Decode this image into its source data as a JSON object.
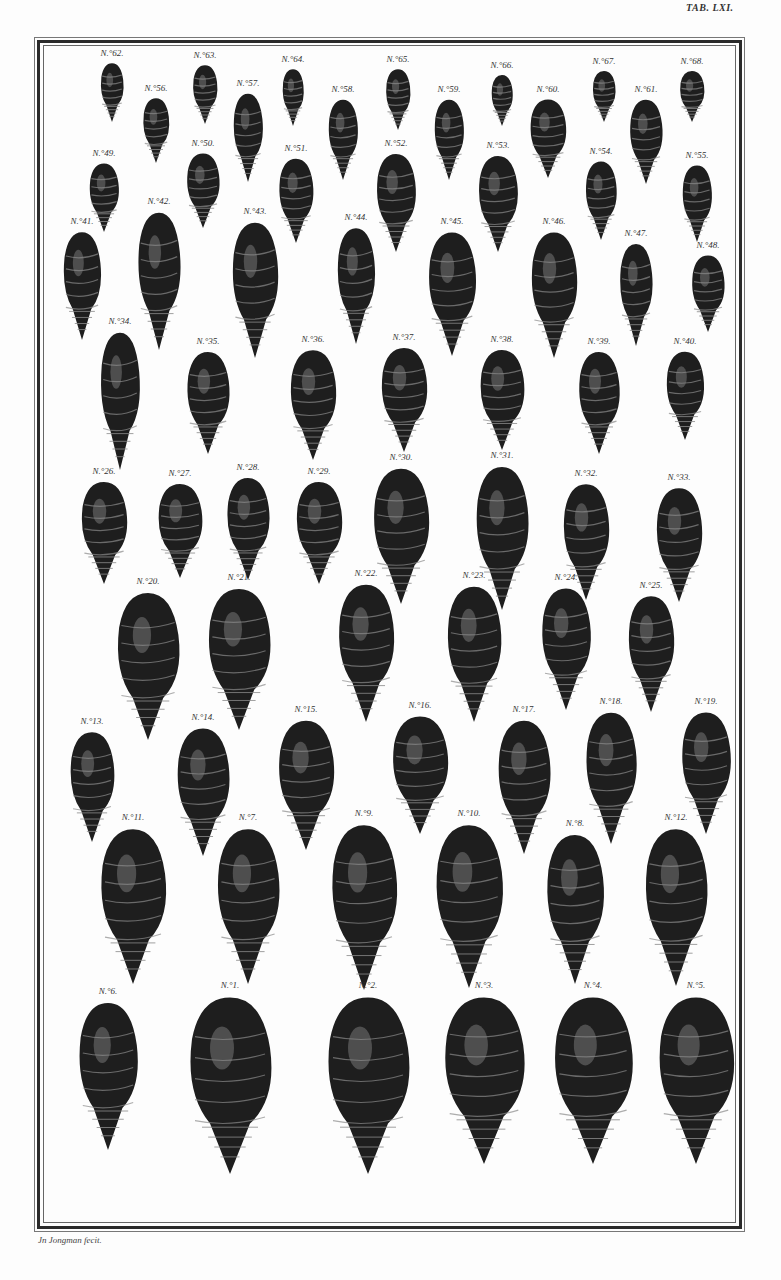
{
  "plate": {
    "title": "TAB. LXI.",
    "signature": "Jn Jongman fecit."
  },
  "colors": {
    "paper": "#fdfdfd",
    "ink": "#1e1e1e",
    "highlight": "#8a8a8a"
  },
  "shells": [
    {
      "label": "N.°62.",
      "x": 104,
      "y": 60,
      "w": 28,
      "h": 60
    },
    {
      "label": "N.°63.",
      "x": 197,
      "y": 62,
      "w": 30,
      "h": 60
    },
    {
      "label": "N.°64.",
      "x": 285,
      "y": 66,
      "w": 26,
      "h": 58
    },
    {
      "label": "N.°65.",
      "x": 390,
      "y": 66,
      "w": 30,
      "h": 62
    },
    {
      "label": "N.°66.",
      "x": 494,
      "y": 72,
      "w": 26,
      "h": 52
    },
    {
      "label": "N.°67.",
      "x": 596,
      "y": 68,
      "w": 28,
      "h": 52
    },
    {
      "label": "N.°68.",
      "x": 684,
      "y": 68,
      "w": 30,
      "h": 52
    },
    {
      "label": "N.°56.",
      "x": 148,
      "y": 95,
      "w": 32,
      "h": 66
    },
    {
      "label": "N.°57.",
      "x": 240,
      "y": 90,
      "w": 36,
      "h": 90
    },
    {
      "label": "N.°58.",
      "x": 335,
      "y": 96,
      "w": 36,
      "h": 82
    },
    {
      "label": "N.°59.",
      "x": 441,
      "y": 96,
      "w": 36,
      "h": 82
    },
    {
      "label": "N.°60.",
      "x": 540,
      "y": 96,
      "w": 44,
      "h": 80
    },
    {
      "label": "N.°61.",
      "x": 638,
      "y": 96,
      "w": 40,
      "h": 86
    },
    {
      "label": "N.°49.",
      "x": 96,
      "y": 160,
      "w": 36,
      "h": 70
    },
    {
      "label": "N.°50.",
      "x": 195,
      "y": 150,
      "w": 40,
      "h": 76
    },
    {
      "label": "N.°51.",
      "x": 288,
      "y": 155,
      "w": 42,
      "h": 86
    },
    {
      "label": "N.°52.",
      "x": 388,
      "y": 150,
      "w": 48,
      "h": 100
    },
    {
      "label": "N.°53.",
      "x": 490,
      "y": 152,
      "w": 48,
      "h": 98
    },
    {
      "label": "N.°54.",
      "x": 593,
      "y": 158,
      "w": 38,
      "h": 80
    },
    {
      "label": "N.°55.",
      "x": 689,
      "y": 162,
      "w": 36,
      "h": 78
    },
    {
      "label": "N.°41.",
      "x": 74,
      "y": 228,
      "w": 46,
      "h": 110
    },
    {
      "label": "N.°42.",
      "x": 151,
      "y": 208,
      "w": 52,
      "h": 140
    },
    {
      "label": "N.°43.",
      "x": 247,
      "y": 218,
      "w": 56,
      "h": 138
    },
    {
      "label": "N.°44.",
      "x": 348,
      "y": 224,
      "w": 46,
      "h": 118
    },
    {
      "label": "N.°45.",
      "x": 444,
      "y": 228,
      "w": 58,
      "h": 126
    },
    {
      "label": "N.°46.",
      "x": 546,
      "y": 228,
      "w": 56,
      "h": 128
    },
    {
      "label": "N.°47.",
      "x": 628,
      "y": 240,
      "w": 40,
      "h": 104
    },
    {
      "label": "N.°48.",
      "x": 700,
      "y": 252,
      "w": 40,
      "h": 78
    },
    {
      "label": "N.°34.",
      "x": 112,
      "y": 328,
      "w": 48,
      "h": 140
    },
    {
      "label": "N.°35.",
      "x": 200,
      "y": 348,
      "w": 52,
      "h": 104
    },
    {
      "label": "N.°36.",
      "x": 305,
      "y": 346,
      "w": 56,
      "h": 112
    },
    {
      "label": "N.°37.",
      "x": 396,
      "y": 344,
      "w": 56,
      "h": 106
    },
    {
      "label": "N.°38.",
      "x": 494,
      "y": 346,
      "w": 54,
      "h": 102
    },
    {
      "label": "N.°39.",
      "x": 591,
      "y": 348,
      "w": 50,
      "h": 104
    },
    {
      "label": "N.°40.",
      "x": 677,
      "y": 348,
      "w": 46,
      "h": 90
    },
    {
      "label": "N.°26.",
      "x": 96,
      "y": 478,
      "w": 56,
      "h": 104
    },
    {
      "label": "N.°27.",
      "x": 172,
      "y": 480,
      "w": 54,
      "h": 96
    },
    {
      "label": "N.°28.",
      "x": 240,
      "y": 474,
      "w": 52,
      "h": 104
    },
    {
      "label": "N.°29.",
      "x": 311,
      "y": 478,
      "w": 56,
      "h": 104
    },
    {
      "label": "N.°30.",
      "x": 393,
      "y": 464,
      "w": 68,
      "h": 138
    },
    {
      "label": "N.°31.",
      "x": 494,
      "y": 462,
      "w": 64,
      "h": 146
    },
    {
      "label": "N.°32.",
      "x": 578,
      "y": 480,
      "w": 56,
      "h": 118
    },
    {
      "label": "N.°33.",
      "x": 671,
      "y": 484,
      "w": 56,
      "h": 116
    },
    {
      "label": "N.°20.",
      "x": 140,
      "y": 588,
      "w": 76,
      "h": 150
    },
    {
      "label": "N.°21.",
      "x": 231,
      "y": 584,
      "w": 76,
      "h": 144
    },
    {
      "label": "N.°22.",
      "x": 358,
      "y": 580,
      "w": 68,
      "h": 140
    },
    {
      "label": "N.°23.",
      "x": 466,
      "y": 582,
      "w": 66,
      "h": 138
    },
    {
      "label": "N.°24.",
      "x": 558,
      "y": 584,
      "w": 60,
      "h": 124
    },
    {
      "label": "N.°25.",
      "x": 643,
      "y": 592,
      "w": 56,
      "h": 118
    },
    {
      "label": "N.°13.",
      "x": 84,
      "y": 728,
      "w": 54,
      "h": 112
    },
    {
      "label": "N.°14.",
      "x": 195,
      "y": 724,
      "w": 64,
      "h": 130
    },
    {
      "label": "N.°15.",
      "x": 298,
      "y": 716,
      "w": 68,
      "h": 132
    },
    {
      "label": "N.°16.",
      "x": 412,
      "y": 712,
      "w": 68,
      "h": 120
    },
    {
      "label": "N.°17.",
      "x": 516,
      "y": 716,
      "w": 64,
      "h": 136
    },
    {
      "label": "N.°18.",
      "x": 603,
      "y": 708,
      "w": 62,
      "h": 134
    },
    {
      "label": "N.°19.",
      "x": 698,
      "y": 708,
      "w": 60,
      "h": 124
    },
    {
      "label": "N.°11.",
      "x": 125,
      "y": 824,
      "w": 80,
      "h": 158
    },
    {
      "label": "N.°7.",
      "x": 240,
      "y": 824,
      "w": 76,
      "h": 158
    },
    {
      "label": "N.°9.",
      "x": 356,
      "y": 820,
      "w": 80,
      "h": 168
    },
    {
      "label": "N.°10.",
      "x": 461,
      "y": 820,
      "w": 82,
      "h": 166
    },
    {
      "label": "N.°8.",
      "x": 567,
      "y": 830,
      "w": 70,
      "h": 152
    },
    {
      "label": "N.°12.",
      "x": 668,
      "y": 824,
      "w": 76,
      "h": 160
    },
    {
      "label": "N.°6.",
      "x": 100,
      "y": 998,
      "w": 72,
      "h": 150
    },
    {
      "label": "N.°1.",
      "x": 222,
      "y": 992,
      "w": 100,
      "h": 180
    },
    {
      "label": "N.°2.",
      "x": 360,
      "y": 992,
      "w": 100,
      "h": 180
    },
    {
      "label": "N.°3.",
      "x": 476,
      "y": 992,
      "w": 98,
      "h": 170
    },
    {
      "label": "N.°4.",
      "x": 585,
      "y": 992,
      "w": 96,
      "h": 170
    },
    {
      "label": "N.°5.",
      "x": 688,
      "y": 992,
      "w": 92,
      "h": 170
    }
  ]
}
